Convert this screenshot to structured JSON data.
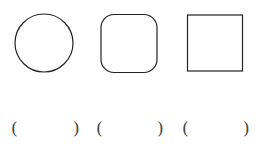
{
  "shapes": [
    {
      "type": "circle",
      "label": "circle"
    },
    {
      "type": "rounded-square",
      "label": "rounded square"
    },
    {
      "type": "square",
      "label": "square"
    }
  ],
  "answers": [
    {
      "open": "(",
      "close": ")",
      "value": ""
    },
    {
      "open": "(",
      "close": ")",
      "value": ""
    },
    {
      "open": "(",
      "close": ")",
      "value": ""
    }
  ],
  "colors": {
    "stroke": "#222222",
    "text": "#444444"
  }
}
